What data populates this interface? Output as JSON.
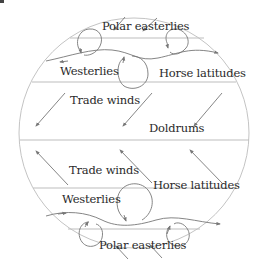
{
  "diagram": {
    "colors": {
      "outline": "#bdbdbd",
      "arrow": "#777777",
      "text": "#2a2a2a",
      "background": "#ffffff"
    },
    "labels": {
      "north_polar_easterlies": "Polar easterlies",
      "north_westerlies": "Westerlies",
      "north_horse_latitudes": "Horse latitudes",
      "north_trade_winds": "Trade winds",
      "doldrums": "Doldrums",
      "south_trade_winds": "Trade winds",
      "south_horse_latitudes": "Horse latitudes",
      "south_westerlies": "Westerlies",
      "south_polar_easterlies": "Polar easterlies"
    },
    "belts_north_to_south": [
      "Polar easterlies",
      "Westerlies",
      "Horse latitudes",
      "Trade winds",
      "Doldrums",
      "Trade winds",
      "Horse latitudes",
      "Westerlies",
      "Polar easterlies"
    ]
  }
}
